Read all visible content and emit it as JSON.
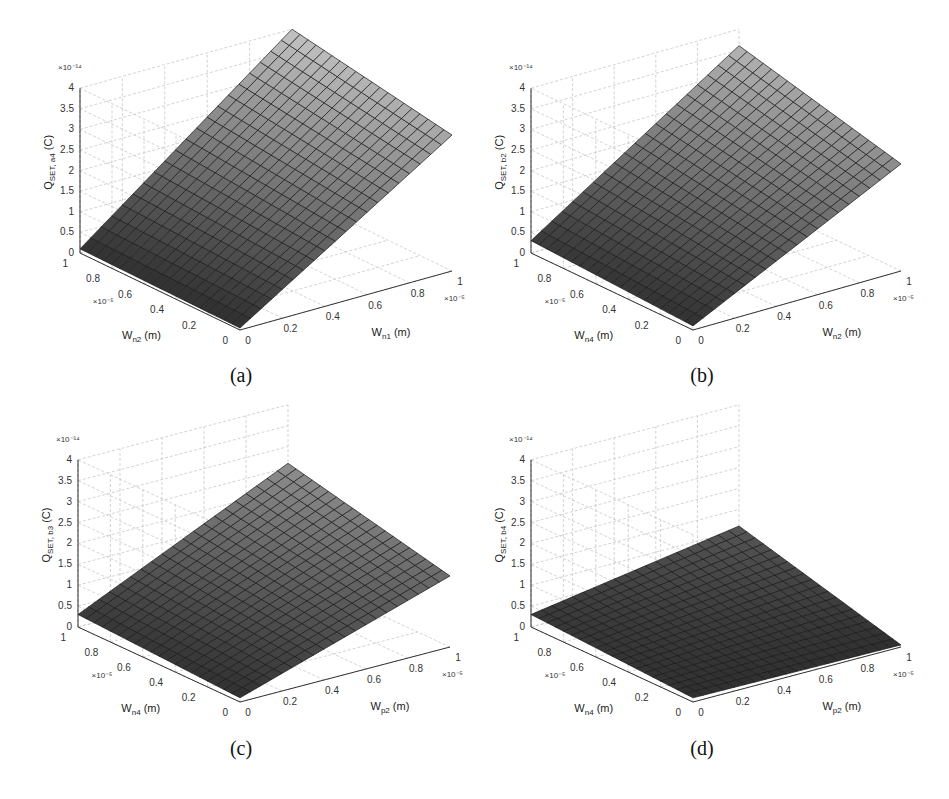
{
  "figure": {
    "panels": [
      {
        "id": "a",
        "caption": "(a)"
      },
      {
        "id": "b",
        "caption": "(b)"
      },
      {
        "id": "c",
        "caption": "(c)"
      },
      {
        "id": "d",
        "caption": "(d)"
      }
    ]
  },
  "chart_data": [
    {
      "type": "surface",
      "panel": "(a)",
      "zlabel_main": "Q",
      "zlabel_sub": "SET, a4",
      "zlabel_unit": "(C)",
      "zmultiplier": "×10⁻¹⁴",
      "xlabel_main": "W",
      "xlabel_sub": "n1",
      "xlabel_unit": "(m)",
      "xmultiplier": "×10⁻⁵",
      "ylabel_main": "W",
      "ylabel_sub": "n2",
      "ylabel_unit": "(m)",
      "ymultiplier": "×10⁻⁵",
      "xticks": [
        0,
        0.2,
        0.4,
        0.6,
        0.8,
        1
      ],
      "yticks": [
        0,
        0.2,
        0.4,
        0.6,
        0.8,
        1
      ],
      "zticks": [
        0,
        0.5,
        1,
        1.5,
        2,
        2.5,
        3,
        3.5,
        4
      ],
      "zlim": [
        0,
        4
      ],
      "corners": {
        "x0y0": 0.05,
        "x0y1": 0.1,
        "x1y0": 3.3,
        "x1y1": 4.0
      },
      "grid": true
    },
    {
      "type": "surface",
      "panel": "(b)",
      "zlabel_main": "Q",
      "zlabel_sub": "SET, b2",
      "zlabel_unit": "(C)",
      "zmultiplier": "×10⁻¹⁴",
      "xlabel_main": "W",
      "xlabel_sub": "n2",
      "xlabel_unit": "(m)",
      "xmultiplier": "×10⁻⁵",
      "ylabel_main": "W",
      "ylabel_sub": "n4",
      "ylabel_unit": "(m)",
      "ymultiplier": "×10⁻⁵",
      "xticks": [
        0,
        0.2,
        0.4,
        0.6,
        0.8,
        1
      ],
      "yticks": [
        0,
        0.2,
        0.4,
        0.6,
        0.8,
        1
      ],
      "zticks": [
        0,
        0.5,
        1,
        1.5,
        2,
        2.5,
        3,
        3.5,
        4
      ],
      "zlim": [
        0,
        4
      ],
      "corners": {
        "x0y0": 0.1,
        "x0y1": 0.3,
        "x1y0": 2.6,
        "x1y1": 3.6
      },
      "grid": true
    },
    {
      "type": "surface",
      "panel": "(c)",
      "zlabel_main": "Q",
      "zlabel_sub": "SET, b3",
      "zlabel_unit": "(C)",
      "zmultiplier": "×10⁻¹⁴",
      "xlabel_main": "W",
      "xlabel_sub": "p2",
      "xlabel_unit": "(m)",
      "xmultiplier": "×10⁻⁵",
      "ylabel_main": "W",
      "ylabel_sub": "n4",
      "ylabel_unit": "(m)",
      "ymultiplier": "×10⁻⁵",
      "xticks": [
        0,
        0.2,
        0.4,
        0.6,
        0.8,
        1
      ],
      "yticks": [
        0,
        0.2,
        0.4,
        0.6,
        0.8,
        1
      ],
      "zticks": [
        0,
        0.5,
        1,
        1.5,
        2,
        2.5,
        3,
        3.5,
        4
      ],
      "zlim": [
        0,
        4
      ],
      "corners": {
        "x0y0": 0.1,
        "x0y1": 0.3,
        "x1y0": 1.7,
        "x1y1": 2.6
      },
      "grid": true
    },
    {
      "type": "surface",
      "panel": "(d)",
      "zlabel_main": "Q",
      "zlabel_sub": "SET, b4",
      "zlabel_unit": "(C)",
      "zmultiplier": "×10⁻¹⁴",
      "xlabel_main": "W",
      "xlabel_sub": "p2",
      "xlabel_unit": "(m)",
      "xmultiplier": "×10⁻⁵",
      "ylabel_main": "W",
      "ylabel_sub": "n4",
      "ylabel_unit": "(m)",
      "ymultiplier": "×10⁻⁵",
      "xticks": [
        0,
        0.2,
        0.4,
        0.6,
        0.8,
        1
      ],
      "yticks": [
        0,
        0.2,
        0.4,
        0.6,
        0.8,
        1
      ],
      "zticks": [
        0,
        0.5,
        1,
        1.5,
        2,
        2.5,
        3,
        3.5,
        4
      ],
      "zlim": [
        0,
        4
      ],
      "corners": {
        "x0y0": 0.1,
        "x0y1": 0.3,
        "x1y0": 0.05,
        "x1y1": 1.1
      },
      "grid": true
    }
  ]
}
